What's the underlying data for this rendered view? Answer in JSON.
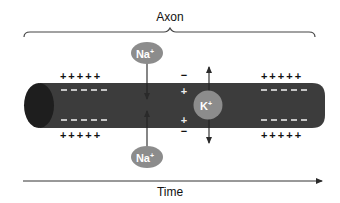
{
  "diagram": {
    "title": "Axon",
    "time_label": "Time",
    "ions": {
      "na_top": {
        "symbol": "Na",
        "charge": "+"
      },
      "na_bottom": {
        "symbol": "Na",
        "charge": "+"
      },
      "k": {
        "symbol": "K",
        "charge": "+"
      }
    },
    "charges": {
      "left_outer_top": "+++++",
      "left_inner_top": "- - - - -",
      "left_inner_bottom": "- - - - -",
      "left_outer_bottom": "+++++",
      "right_outer_top": "+++++",
      "right_inner_top": "- - - - -",
      "right_inner_bottom": "- - - - -",
      "right_outer_bottom": "+++++",
      "mid_outer_top": "−",
      "mid_inner_top": "+",
      "mid_inner_bottom": "+",
      "mid_outer_bottom": "−"
    },
    "colors": {
      "axon_body": "#3c3c3c",
      "axon_cap": "#1e1e1e",
      "ion_fill": "#8c8c8c",
      "ion_text": "#ffffff",
      "line": "#2a2a2a",
      "text": "#111111"
    }
  }
}
